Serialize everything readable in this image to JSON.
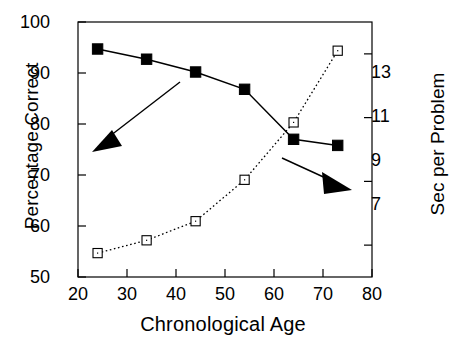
{
  "chart_data": {
    "type": "line",
    "title": "",
    "xlabel": "Chronological Age",
    "ylabel": "Percentage Correct",
    "y2label": "Sec per Problem",
    "xlim": [
      20,
      80
    ],
    "ylim": [
      50,
      100
    ],
    "y2lim": [
      6.0,
      14.0
    ],
    "xticks": [
      20,
      30,
      40,
      50,
      60,
      70,
      80
    ],
    "yticks": [
      50,
      60,
      70,
      80,
      90,
      100
    ],
    "y2ticks": [
      7,
      9,
      11,
      13
    ],
    "grid": false,
    "legend": "none (series identified by arrow annotations)",
    "x": [
      24,
      34,
      44,
      54,
      64,
      73
    ],
    "series": [
      {
        "name": "Percentage Correct",
        "axis": "left",
        "marker": "filled-square",
        "linestyle": "solid",
        "color": "#000000",
        "values": [
          94.7,
          92.7,
          90.2,
          86.8,
          77.0,
          75.8
        ]
      },
      {
        "name": "Sec per Problem",
        "axis": "right",
        "marker": "open-square",
        "linestyle": "dotted",
        "color": "#000000",
        "values": [
          6.75,
          7.15,
          7.75,
          9.05,
          10.85,
          13.1
        ]
      }
    ],
    "annotations": [
      {
        "name": "arrow-to-left-axis",
        "text": "",
        "points_to": "Percentage Correct (left axis)",
        "direction": "down-left"
      },
      {
        "name": "arrow-to-right-axis",
        "text": "",
        "points_to": "Sec per Problem (right axis)",
        "direction": "down-right"
      }
    ]
  },
  "axes": {
    "left": {
      "label": "Percentage Correct",
      "ticks": [
        "100",
        "90",
        "80",
        "70",
        "60",
        "50"
      ]
    },
    "right": {
      "label": "Sec per Problem",
      "ticks": [
        "13",
        "11",
        "9",
        "7"
      ]
    },
    "bottom": {
      "label": "Chronological Age",
      "ticks": [
        "20",
        "30",
        "40",
        "50",
        "60",
        "70",
        "80"
      ]
    }
  }
}
